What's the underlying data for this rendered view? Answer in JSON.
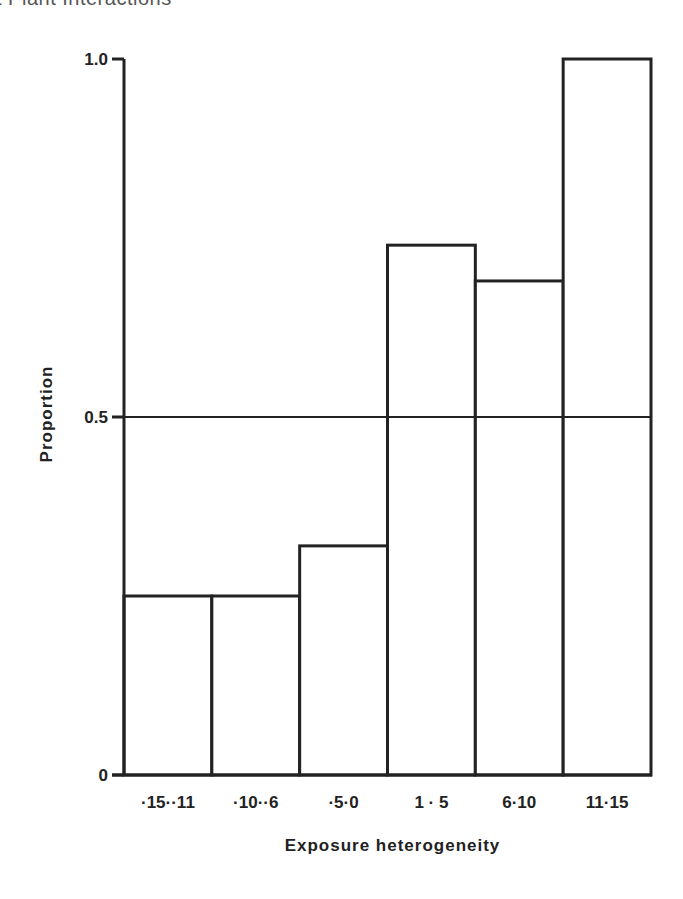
{
  "page": {
    "header_fragment": "t Plant Interactions"
  },
  "chart_data": {
    "type": "bar",
    "title": "",
    "xlabel": "Exposure heterogeneity",
    "ylabel": "Proportion",
    "categories": [
      "-15--11",
      "-10--6",
      "-5-0",
      "1-5",
      "6-10",
      "11-15"
    ],
    "category_labels": [
      "·15··11",
      "·10··6",
      "·5·0",
      "1 · 5",
      "6·10",
      "11·15"
    ],
    "values": [
      0.25,
      0.25,
      0.32,
      0.74,
      0.69,
      1.0
    ],
    "ylim": [
      0,
      1.0
    ],
    "yticks": [
      0,
      0.5,
      1.0
    ],
    "ytick_labels": [
      "0",
      "0.5",
      "1.0"
    ],
    "reference_line": 0.5,
    "grid": false,
    "legend": "none",
    "bar_fill": "#ffffff",
    "bar_stroke": "#222222"
  }
}
